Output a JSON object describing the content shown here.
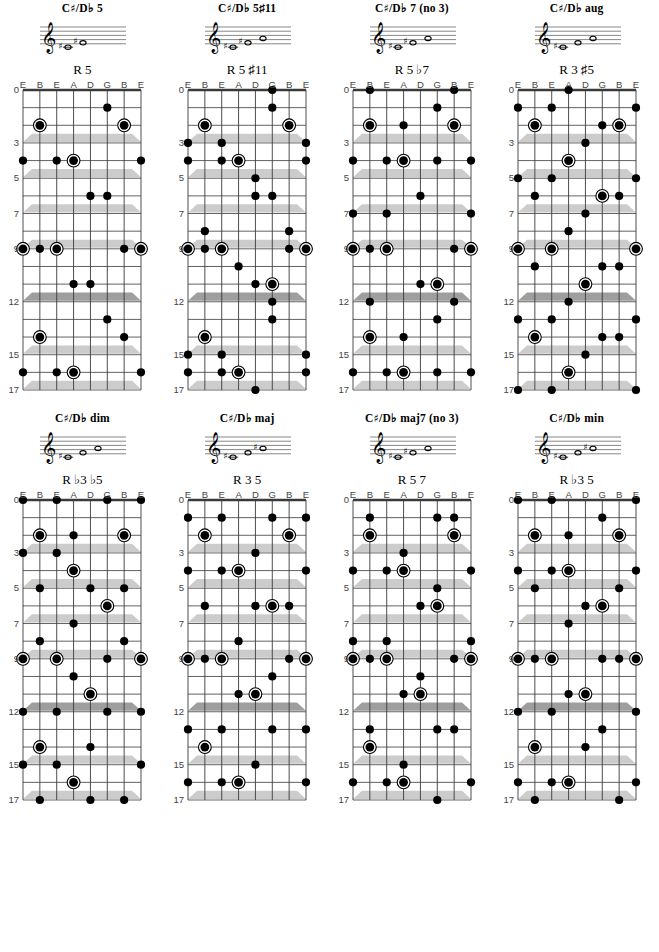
{
  "page": {
    "string_labels": [
      "E",
      "B",
      "E",
      "A",
      "D",
      "G",
      "B",
      "E"
    ],
    "fret_labels": [
      {
        "fret": 0,
        "label": "0"
      },
      {
        "fret": 3,
        "label": "3"
      },
      {
        "fret": 5,
        "label": "5"
      },
      {
        "fret": 7,
        "label": "7"
      },
      {
        "fret": 9,
        "label": "9"
      },
      {
        "fret": 12,
        "label": "12"
      },
      {
        "fret": 15,
        "label": "15"
      },
      {
        "fret": 17,
        "label": "17"
      }
    ],
    "inlay_frets": [
      3,
      5,
      7,
      9,
      12,
      15,
      17
    ],
    "double_inlay_frets": [
      12
    ],
    "total_frets": 17,
    "num_strings": 8,
    "colors": {
      "ink": "#000000",
      "grid": "#3a3a3a",
      "inlay": "#cccccc",
      "inlay_double": "#9e9e9e",
      "label": "#444444"
    }
  },
  "chords": [
    {
      "id": "c-sharp-d-flat-5",
      "title_root": "C",
      "title_acc": "♯",
      "title_alt": "/D♭",
      "title_suffix": "5",
      "title_plain": "C♯/D♭ 5",
      "formula": "R 5",
      "staff_notes": [
        "C♯",
        "G♯"
      ],
      "roots": [
        [
          1,
          2
        ],
        [
          6,
          2
        ],
        [
          3,
          4
        ],
        [
          0,
          9
        ],
        [
          2,
          9
        ],
        [
          7,
          9
        ],
        [
          1,
          14
        ],
        [
          3,
          16
        ]
      ],
      "tones": [
        [
          5,
          1
        ],
        [
          0,
          4
        ],
        [
          2,
          4
        ],
        [
          7,
          4
        ],
        [
          4,
          6
        ],
        [
          5,
          6
        ],
        [
          1,
          9
        ],
        [
          6,
          9
        ],
        [
          3,
          11
        ],
        [
          4,
          11
        ],
        [
          5,
          13
        ],
        [
          6,
          14
        ],
        [
          0,
          16
        ],
        [
          2,
          16
        ],
        [
          7,
          16
        ]
      ]
    },
    {
      "id": "c-sharp-d-flat-5-sharp-11",
      "title_root": "C",
      "title_acc": "♯",
      "title_alt": "/D♭",
      "title_suffix": "5♯11",
      "title_plain": "C♯/D♭ 5♯11",
      "formula": "R 5 ♯11",
      "staff_notes": [
        "C♯",
        "G♯",
        "G"
      ],
      "roots": [
        [
          1,
          2
        ],
        [
          6,
          2
        ],
        [
          3,
          4
        ],
        [
          0,
          9
        ],
        [
          2,
          9
        ],
        [
          7,
          9
        ],
        [
          5,
          11
        ],
        [
          1,
          14
        ],
        [
          3,
          16
        ]
      ],
      "tones": [
        [
          5,
          0
        ],
        [
          5,
          1
        ],
        [
          0,
          3
        ],
        [
          2,
          3
        ],
        [
          7,
          3
        ],
        [
          0,
          4
        ],
        [
          2,
          4
        ],
        [
          7,
          4
        ],
        [
          4,
          5
        ],
        [
          4,
          6
        ],
        [
          5,
          6
        ],
        [
          1,
          8
        ],
        [
          6,
          8
        ],
        [
          1,
          9
        ],
        [
          6,
          9
        ],
        [
          3,
          10
        ],
        [
          4,
          11
        ],
        [
          5,
          12
        ],
        [
          5,
          13
        ],
        [
          0,
          15
        ],
        [
          2,
          15
        ],
        [
          7,
          15
        ],
        [
          0,
          16
        ],
        [
          2,
          16
        ],
        [
          7,
          16
        ],
        [
          4,
          17
        ]
      ]
    },
    {
      "id": "c-sharp-d-flat-7-no-3",
      "title_root": "C",
      "title_acc": "♯",
      "title_alt": "/D♭",
      "title_suffix": "7 (no 3)",
      "title_plain": "C♯/D♭ 7 (no 3)",
      "formula": "R 5 ♭7",
      "staff_notes": [
        "C♯",
        "G♯",
        "B"
      ],
      "roots": [
        [
          1,
          2
        ],
        [
          6,
          2
        ],
        [
          3,
          4
        ],
        [
          0,
          9
        ],
        [
          2,
          9
        ],
        [
          7,
          9
        ],
        [
          5,
          11
        ],
        [
          1,
          14
        ],
        [
          3,
          16
        ]
      ],
      "tones": [
        [
          1,
          0
        ],
        [
          6,
          0
        ],
        [
          5,
          1
        ],
        [
          3,
          2
        ],
        [
          0,
          4
        ],
        [
          2,
          4
        ],
        [
          5,
          4
        ],
        [
          7,
          4
        ],
        [
          4,
          6
        ],
        [
          0,
          7
        ],
        [
          2,
          7
        ],
        [
          7,
          7
        ],
        [
          1,
          9
        ],
        [
          6,
          9
        ],
        [
          4,
          11
        ],
        [
          1,
          12
        ],
        [
          6,
          12
        ],
        [
          5,
          13
        ],
        [
          3,
          14
        ],
        [
          0,
          16
        ],
        [
          2,
          16
        ],
        [
          5,
          16
        ],
        [
          7,
          16
        ]
      ]
    },
    {
      "id": "c-sharp-d-flat-aug",
      "title_root": "C",
      "title_acc": "♯",
      "title_alt": "/D♭",
      "title_suffix": "aug",
      "title_plain": "C♯/D♭ aug",
      "formula": "R 3 ♯5",
      "staff_notes": [
        "C♯",
        "F",
        "A"
      ],
      "roots": [
        [
          1,
          2
        ],
        [
          6,
          2
        ],
        [
          3,
          4
        ],
        [
          5,
          6
        ],
        [
          0,
          9
        ],
        [
          2,
          9
        ],
        [
          7,
          9
        ],
        [
          4,
          11
        ],
        [
          1,
          14
        ],
        [
          3,
          16
        ]
      ],
      "tones": [
        [
          3,
          0
        ],
        [
          0,
          1
        ],
        [
          2,
          1
        ],
        [
          7,
          1
        ],
        [
          5,
          2
        ],
        [
          4,
          3
        ],
        [
          0,
          5
        ],
        [
          2,
          5
        ],
        [
          7,
          5
        ],
        [
          1,
          6
        ],
        [
          6,
          6
        ],
        [
          4,
          7
        ],
        [
          3,
          8
        ],
        [
          1,
          10
        ],
        [
          5,
          10
        ],
        [
          6,
          10
        ],
        [
          3,
          12
        ],
        [
          0,
          13
        ],
        [
          2,
          13
        ],
        [
          7,
          13
        ],
        [
          5,
          14
        ],
        [
          6,
          14
        ],
        [
          4,
          15
        ],
        [
          0,
          17
        ],
        [
          2,
          17
        ],
        [
          7,
          17
        ]
      ]
    },
    {
      "id": "c-sharp-d-flat-dim",
      "title_root": "C",
      "title_acc": "♯",
      "title_alt": "/D♭",
      "title_suffix": "dim",
      "title_plain": "C♯/D♭ dim",
      "formula": "R ♭3 ♭5",
      "staff_notes": [
        "C♯",
        "E",
        "G"
      ],
      "roots": [
        [
          1,
          2
        ],
        [
          6,
          2
        ],
        [
          3,
          4
        ],
        [
          5,
          6
        ],
        [
          0,
          9
        ],
        [
          2,
          9
        ],
        [
          7,
          9
        ],
        [
          4,
          11
        ],
        [
          1,
          14
        ],
        [
          3,
          16
        ]
      ],
      "tones": [
        [
          0,
          0
        ],
        [
          2,
          0
        ],
        [
          5,
          0
        ],
        [
          7,
          0
        ],
        [
          3,
          2
        ],
        [
          0,
          3
        ],
        [
          2,
          3
        ],
        [
          1,
          5
        ],
        [
          4,
          5
        ],
        [
          6,
          5
        ],
        [
          3,
          7
        ],
        [
          1,
          8
        ],
        [
          6,
          8
        ],
        [
          5,
          9
        ],
        [
          3,
          10
        ],
        [
          0,
          12
        ],
        [
          2,
          12
        ],
        [
          5,
          12
        ],
        [
          7,
          12
        ],
        [
          4,
          14
        ],
        [
          0,
          15
        ],
        [
          2,
          15
        ],
        [
          7,
          15
        ],
        [
          1,
          17
        ],
        [
          4,
          17
        ],
        [
          6,
          17
        ]
      ]
    },
    {
      "id": "c-sharp-d-flat-maj",
      "title_root": "C",
      "title_acc": "♯",
      "title_alt": "/D♭",
      "title_suffix": "maj",
      "title_plain": "C♯/D♭ maj",
      "formula": "R 3 5",
      "staff_notes": [
        "C♯",
        "F",
        "G♯"
      ],
      "roots": [
        [
          1,
          2
        ],
        [
          6,
          2
        ],
        [
          3,
          4
        ],
        [
          5,
          6
        ],
        [
          0,
          9
        ],
        [
          2,
          9
        ],
        [
          7,
          9
        ],
        [
          4,
          11
        ],
        [
          1,
          14
        ],
        [
          3,
          16
        ]
      ],
      "tones": [
        [
          0,
          1
        ],
        [
          2,
          1
        ],
        [
          5,
          1
        ],
        [
          7,
          1
        ],
        [
          4,
          3
        ],
        [
          0,
          4
        ],
        [
          2,
          4
        ],
        [
          7,
          4
        ],
        [
          1,
          6
        ],
        [
          4,
          6
        ],
        [
          6,
          6
        ],
        [
          3,
          8
        ],
        [
          1,
          9
        ],
        [
          6,
          9
        ],
        [
          5,
          10
        ],
        [
          3,
          11
        ],
        [
          0,
          13
        ],
        [
          2,
          13
        ],
        [
          5,
          13
        ],
        [
          7,
          13
        ],
        [
          4,
          15
        ],
        [
          0,
          16
        ],
        [
          2,
          16
        ],
        [
          7,
          16
        ]
      ]
    },
    {
      "id": "c-sharp-d-flat-maj7-no-3",
      "title_root": "C",
      "title_acc": "♯",
      "title_alt": "/D♭",
      "title_suffix": "maj7 (no 3)",
      "title_plain": "C♯/D♭ maj7 (no 3)",
      "formula": "R 5 7",
      "staff_notes": [
        "C♯",
        "G♯",
        "C"
      ],
      "roots": [
        [
          1,
          2
        ],
        [
          6,
          2
        ],
        [
          3,
          4
        ],
        [
          5,
          6
        ],
        [
          0,
          9
        ],
        [
          2,
          9
        ],
        [
          7,
          9
        ],
        [
          4,
          11
        ],
        [
          1,
          14
        ],
        [
          3,
          16
        ]
      ],
      "tones": [
        [
          1,
          1
        ],
        [
          5,
          1
        ],
        [
          6,
          1
        ],
        [
          3,
          3
        ],
        [
          0,
          4
        ],
        [
          2,
          4
        ],
        [
          7,
          4
        ],
        [
          5,
          5
        ],
        [
          4,
          6
        ],
        [
          0,
          8
        ],
        [
          2,
          8
        ],
        [
          7,
          8
        ],
        [
          1,
          9
        ],
        [
          6,
          9
        ],
        [
          4,
          10
        ],
        [
          3,
          11
        ],
        [
          1,
          13
        ],
        [
          5,
          13
        ],
        [
          6,
          13
        ],
        [
          3,
          15
        ],
        [
          0,
          16
        ],
        [
          2,
          16
        ],
        [
          7,
          16
        ],
        [
          5,
          17
        ]
      ]
    },
    {
      "id": "c-sharp-d-flat-min",
      "title_root": "C",
      "title_acc": "♯",
      "title_alt": "/D♭",
      "title_suffix": "min",
      "title_plain": "C♯/D♭ min",
      "formula": "R ♭3 5",
      "staff_notes": [
        "C♯",
        "E",
        "G♯"
      ],
      "roots": [
        [
          1,
          2
        ],
        [
          6,
          2
        ],
        [
          3,
          4
        ],
        [
          5,
          6
        ],
        [
          0,
          9
        ],
        [
          2,
          9
        ],
        [
          7,
          9
        ],
        [
          4,
          11
        ],
        [
          1,
          14
        ],
        [
          3,
          16
        ]
      ],
      "tones": [
        [
          0,
          0
        ],
        [
          2,
          0
        ],
        [
          7,
          0
        ],
        [
          5,
          1
        ],
        [
          3,
          2
        ],
        [
          0,
          4
        ],
        [
          2,
          4
        ],
        [
          7,
          4
        ],
        [
          1,
          5
        ],
        [
          6,
          5
        ],
        [
          4,
          6
        ],
        [
          3,
          7
        ],
        [
          1,
          9
        ],
        [
          5,
          9
        ],
        [
          6,
          9
        ],
        [
          3,
          11
        ],
        [
          0,
          12
        ],
        [
          2,
          12
        ],
        [
          7,
          12
        ],
        [
          5,
          13
        ],
        [
          4,
          14
        ],
        [
          0,
          16
        ],
        [
          2,
          16
        ],
        [
          7,
          16
        ],
        [
          1,
          17
        ],
        [
          6,
          17
        ]
      ]
    }
  ]
}
